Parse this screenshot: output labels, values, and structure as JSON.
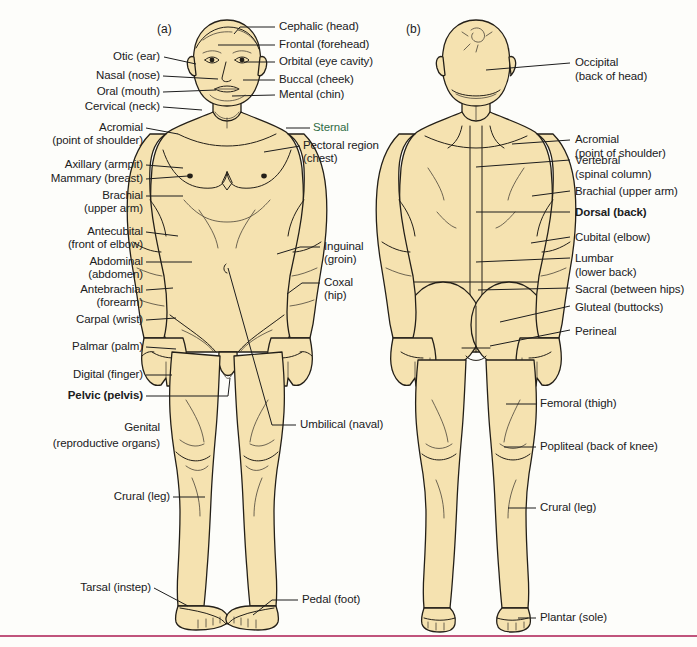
{
  "figure": {
    "panel_a_letter": "(a)",
    "panel_b_letter": "(b)",
    "skin_color": "#f5e2b0",
    "outline_color": "#231f18",
    "label_color": "#20201c",
    "rule_color": "#c0547c",
    "highlight_color": "#2f6b45"
  },
  "anterior_labels_left": [
    {
      "name": "otic",
      "text": "Otic (ear)"
    },
    {
      "name": "nasal",
      "text": "Nasal (nose)"
    },
    {
      "name": "oral",
      "text": "Oral (mouth)"
    },
    {
      "name": "cervical",
      "text": "Cervical (neck)"
    },
    {
      "name": "acromial",
      "text": "Acromial"
    },
    {
      "name": "acromial-sub",
      "text": "(point of shoulder)"
    },
    {
      "name": "axillary",
      "text": "Axillary (armpit)"
    },
    {
      "name": "mammary",
      "text": "Mammary (breast)"
    },
    {
      "name": "brachial",
      "text": "Brachial"
    },
    {
      "name": "brachial-sub",
      "text": "(upper arm)"
    },
    {
      "name": "antecubital",
      "text": "Antecubital"
    },
    {
      "name": "antecubital-sub",
      "text": "(front of elbow)"
    },
    {
      "name": "abdominal",
      "text": "Abdominal"
    },
    {
      "name": "abdominal-sub",
      "text": "(abdomen)"
    },
    {
      "name": "antebrachial",
      "text": "Antebrachial"
    },
    {
      "name": "antebrachial-sub",
      "text": "(forearm)"
    },
    {
      "name": "carpal",
      "text": "Carpal (wrist)"
    },
    {
      "name": "palmar",
      "text": "Palmar (palm)"
    },
    {
      "name": "digital",
      "text": "Digital (finger)"
    },
    {
      "name": "pelvic",
      "text": "Pelvic (pelvis)"
    },
    {
      "name": "genital",
      "text": "Genital"
    },
    {
      "name": "genital-sub",
      "text": "(reproductive organs)"
    },
    {
      "name": "crural",
      "text": "Crural (leg)"
    },
    {
      "name": "tarsal",
      "text": "Tarsal (instep)"
    }
  ],
  "anterior_labels_right": [
    {
      "name": "cephalic",
      "text": "Cephalic (head)"
    },
    {
      "name": "frontal",
      "text": "Frontal (forehead)"
    },
    {
      "name": "orbital",
      "text": "Orbital (eye cavity)"
    },
    {
      "name": "buccal",
      "text": "Buccal (cheek)"
    },
    {
      "name": "mental",
      "text": "Mental (chin)"
    },
    {
      "name": "sternal",
      "text": "Sternal"
    },
    {
      "name": "pectoral",
      "text": "Pectoral region"
    },
    {
      "name": "pectoral-sub",
      "text": "(chest)"
    },
    {
      "name": "inguinal",
      "text": "Inguinal"
    },
    {
      "name": "inguinal-sub",
      "text": "(groin)"
    },
    {
      "name": "coxal",
      "text": "Coxal"
    },
    {
      "name": "coxal-sub",
      "text": "(hip)"
    },
    {
      "name": "umbilical",
      "text": "Umbilical (naval)"
    },
    {
      "name": "pedal",
      "text": "Pedal (foot)"
    }
  ],
  "posterior_labels": [
    {
      "name": "occipital",
      "text": "Occipital"
    },
    {
      "name": "occipital-sub",
      "text": "(back of head)"
    },
    {
      "name": "acromial",
      "text": "Acromial"
    },
    {
      "name": "acromial-sub",
      "text": "(point of shoulder)"
    },
    {
      "name": "vertebral",
      "text": "Vertebral"
    },
    {
      "name": "vertebral-sub",
      "text": "(spinal column)"
    },
    {
      "name": "brachial",
      "text": "Brachial (upper arm)"
    },
    {
      "name": "dorsal",
      "text": "Dorsal (back)"
    },
    {
      "name": "cubital",
      "text": "Cubital (elbow)"
    },
    {
      "name": "lumbar",
      "text": "Lumbar"
    },
    {
      "name": "lumbar-sub",
      "text": "(lower back)"
    },
    {
      "name": "sacral",
      "text": "Sacral (between hips)"
    },
    {
      "name": "gluteal",
      "text": "Gluteal (buttocks)"
    },
    {
      "name": "perineal",
      "text": "Perineal"
    },
    {
      "name": "femoral",
      "text": "Femoral (thigh)"
    },
    {
      "name": "popliteal",
      "text": "Popliteal (back of knee)"
    },
    {
      "name": "crural",
      "text": "Crural (leg)"
    },
    {
      "name": "plantar",
      "text": "Plantar (sole)"
    }
  ]
}
